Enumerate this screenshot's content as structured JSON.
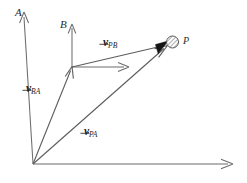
{
  "figure": {
    "kind": "relative-velocity-vector-diagram",
    "background_color": "#ffffff",
    "stroke_color": "#4a4a4a",
    "label_color": "#2b2b2b",
    "arrowhead_fill": "#141414"
  },
  "axes": {
    "frame_a": {
      "label": "A",
      "label_x": 15,
      "label_y": 7,
      "origin": {
        "x": 33,
        "y": 164
      },
      "vertical_tip": {
        "x": 24,
        "y": 13
      },
      "horizontal_tip": {
        "x": 232,
        "y": 164
      }
    },
    "frame_b": {
      "label": "B",
      "label_x": 60,
      "label_y": 19,
      "origin": {
        "x": 72,
        "y": 67
      },
      "vertical_tip": {
        "x": 72,
        "y": 25
      },
      "horizontal_tip": {
        "x": 128,
        "y": 67
      }
    }
  },
  "point": {
    "label": "P",
    "label_x": 183,
    "label_y": 36,
    "center": {
      "x": 172,
      "y": 42
    },
    "radius": 6,
    "fill_pattern": "hatched"
  },
  "vectors": [
    {
      "name": "v_BA",
      "symbol": "v",
      "subscript": "BA",
      "from": {
        "x": 33,
        "y": 164
      },
      "to": {
        "x": 72,
        "y": 67
      },
      "label_x": 26,
      "label_y": 79
    },
    {
      "name": "v_PB",
      "symbol": "v",
      "subscript": "PB",
      "from": {
        "x": 72,
        "y": 67
      },
      "to": {
        "x": 167,
        "y": 44
      },
      "label_x": 103,
      "label_y": 33
    },
    {
      "name": "v_PA",
      "symbol": "v",
      "subscript": "PA",
      "from": {
        "x": 33,
        "y": 164
      },
      "to": {
        "x": 167,
        "y": 46
      },
      "label_x": 84,
      "label_y": 122
    }
  ]
}
